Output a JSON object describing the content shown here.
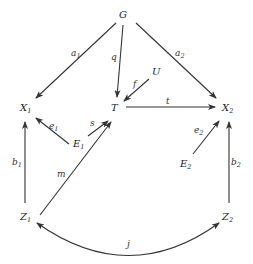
{
  "diagram": {
    "nodes": [
      {
        "id": "G",
        "label": "G",
        "sub": "",
        "x": 123,
        "y": 18
      },
      {
        "id": "U",
        "label": "U",
        "sub": "",
        "x": 155,
        "y": 75
      },
      {
        "id": "X1",
        "label": "X",
        "sub": "1",
        "x": 24,
        "y": 111
      },
      {
        "id": "T",
        "label": "T",
        "sub": "",
        "x": 112,
        "y": 111
      },
      {
        "id": "X2",
        "label": "X",
        "sub": "2",
        "x": 224,
        "y": 111
      },
      {
        "id": "E1",
        "label": "E",
        "sub": "1",
        "x": 75,
        "y": 147
      },
      {
        "id": "E2",
        "label": "E",
        "sub": "2",
        "x": 181,
        "y": 167
      },
      {
        "id": "Z1",
        "label": "Z",
        "sub": "1",
        "x": 24,
        "y": 220
      },
      {
        "id": "Z2",
        "label": "Z",
        "sub": "2",
        "x": 224,
        "y": 220
      }
    ],
    "edges": [
      {
        "id": "a1",
        "from": "G",
        "to": "X1",
        "label": "a",
        "sub": "1"
      },
      {
        "id": "q",
        "from": "G",
        "to": "T",
        "label": "q",
        "sub": ""
      },
      {
        "id": "a2",
        "from": "G",
        "to": "X2",
        "label": "a",
        "sub": "2"
      },
      {
        "id": "f",
        "from": "U",
        "to": "T",
        "label": "f",
        "sub": ""
      },
      {
        "id": "t",
        "from": "T",
        "to": "X2",
        "label": "t",
        "sub": ""
      },
      {
        "id": "e1",
        "from": "E1",
        "to": "X1",
        "label": "e",
        "sub": "1"
      },
      {
        "id": "s",
        "from": "E1",
        "to": "T",
        "label": "s",
        "sub": ""
      },
      {
        "id": "e2",
        "from": "E2",
        "to": "X2",
        "label": "e",
        "sub": "2"
      },
      {
        "id": "b1",
        "from": "Z1",
        "to": "X1",
        "label": "b",
        "sub": "1"
      },
      {
        "id": "m",
        "from": "Z1",
        "to": "T",
        "label": "m",
        "sub": ""
      },
      {
        "id": "b2",
        "from": "Z2",
        "to": "X2",
        "label": "b",
        "sub": "2"
      },
      {
        "id": "j",
        "from": "Z1",
        "to": "Z2",
        "label": "j",
        "sub": "",
        "bidirectional": true
      }
    ]
  },
  "labels": {
    "G": "G",
    "U": "U",
    "T": "T",
    "X": "X",
    "E": "E",
    "Z": "Z",
    "one": "1",
    "two": "2",
    "a": "a",
    "q": "q",
    "f": "f",
    "t": "t",
    "e": "e",
    "s": "s",
    "b": "b",
    "m": "m",
    "j": "j"
  },
  "colors": {
    "ink": "#333333",
    "background": "#ffffff"
  }
}
